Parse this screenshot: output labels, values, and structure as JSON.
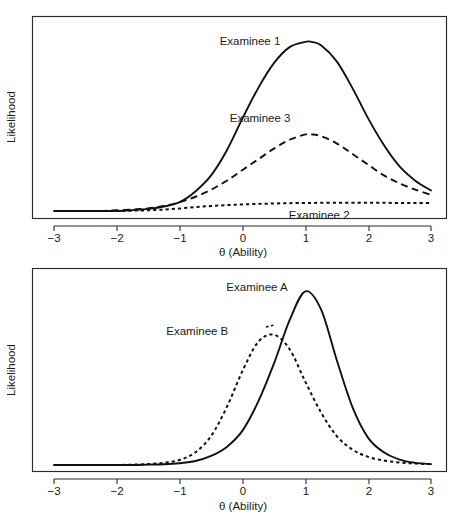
{
  "figure": {
    "name": "likelihood-functions-ability",
    "panel_count": 2
  },
  "chart_data": [
    {
      "type": "line",
      "panel": "top",
      "title": "",
      "xlabel": "θ (Ability)",
      "ylabel": "Likelihood",
      "xlim": [
        -3,
        3
      ],
      "ylim": [
        0,
        1.05
      ],
      "xticks": [
        -3,
        -2,
        -1,
        0,
        1,
        2,
        3
      ],
      "xticklabels": [
        "−3",
        "−2",
        "−1",
        "0",
        "1",
        "2",
        "3"
      ],
      "yticks": [],
      "grid": false,
      "legend": "inline-annotations",
      "x": [
        -3.0,
        -2.75,
        -2.5,
        -2.25,
        -2.0,
        -1.75,
        -1.5,
        -1.25,
        -1.0,
        -0.75,
        -0.5,
        -0.25,
        0.0,
        0.25,
        0.5,
        0.75,
        1.0,
        1.1,
        1.25,
        1.5,
        1.75,
        2.0,
        2.25,
        2.5,
        2.75,
        3.0
      ],
      "series": [
        {
          "name": "Examinee 1",
          "style": "solid",
          "peak_x": 1.1,
          "peak_y": 0.95,
          "label_x": 0.12,
          "label_y": 0.93,
          "values": [
            0.0,
            0.0,
            0.0,
            0.0,
            0.0,
            0.005,
            0.012,
            0.025,
            0.05,
            0.11,
            0.2,
            0.34,
            0.52,
            0.69,
            0.83,
            0.92,
            0.95,
            0.95,
            0.93,
            0.84,
            0.69,
            0.52,
            0.37,
            0.25,
            0.17,
            0.115
          ]
        },
        {
          "name": "Examinee 3",
          "style": "dashed",
          "peak_x": 1.0,
          "peak_y": 0.43,
          "label_x": 0.28,
          "label_y": 0.5,
          "values": [
            0.0,
            0.0,
            0.0,
            0.0,
            0.004,
            0.008,
            0.015,
            0.028,
            0.05,
            0.08,
            0.12,
            0.17,
            0.23,
            0.29,
            0.35,
            0.4,
            0.43,
            0.43,
            0.42,
            0.38,
            0.32,
            0.26,
            0.2,
            0.155,
            0.12,
            0.09
          ]
        },
        {
          "name": "Examinee 2",
          "style": "dotted",
          "peak_x": 2.0,
          "peak_y": 0.045,
          "label_x": 1.22,
          "label_y": -0.045,
          "values": [
            0.0,
            0.0,
            0.0,
            0.0,
            0.0,
            0.002,
            0.004,
            0.008,
            0.014,
            0.022,
            0.028,
            0.033,
            0.037,
            0.04,
            0.042,
            0.044,
            0.045,
            0.045,
            0.046,
            0.046,
            0.046,
            0.046,
            0.046,
            0.045,
            0.045,
            0.045
          ]
        }
      ]
    },
    {
      "type": "line",
      "panel": "bottom",
      "title": "",
      "xlabel": "θ (Ability)",
      "ylabel": "Likelihood",
      "xlim": [
        -3,
        3
      ],
      "ylim": [
        0,
        1.05
      ],
      "xticks": [
        -3,
        -2,
        -1,
        0,
        1,
        2,
        3
      ],
      "xticklabels": [
        "−3",
        "−2",
        "−1",
        "0",
        "1",
        "2",
        "3"
      ],
      "yticks": [],
      "grid": false,
      "legend": "inline-annotations",
      "x": [
        -3.0,
        -2.75,
        -2.5,
        -2.25,
        -2.0,
        -1.75,
        -1.5,
        -1.25,
        -1.0,
        -0.75,
        -0.5,
        -0.25,
        0.0,
        0.25,
        0.5,
        0.75,
        1.0,
        1.25,
        1.5,
        1.75,
        2.0,
        2.25,
        2.5,
        2.75,
        3.0
      ],
      "series": [
        {
          "name": "Examinee A",
          "style": "solid",
          "peak_x": 1.0,
          "peak_y": 0.96,
          "label_x": 0.23,
          "label_y": 0.96,
          "values": [
            0.0,
            0.0,
            0.0,
            0.0,
            0.0,
            0.0,
            0.002,
            0.004,
            0.01,
            0.022,
            0.05,
            0.1,
            0.19,
            0.35,
            0.56,
            0.8,
            0.96,
            0.86,
            0.58,
            0.32,
            0.15,
            0.07,
            0.03,
            0.012,
            0.005
          ]
        },
        {
          "name": "Examinee B",
          "style": "dotted",
          "peak_x": 0.5,
          "peak_y": 0.72,
          "label_x": -0.72,
          "label_y": 0.72,
          "values": [
            0.0,
            0.0,
            0.0,
            0.0,
            0.0,
            0.002,
            0.005,
            0.012,
            0.028,
            0.07,
            0.16,
            0.32,
            0.52,
            0.68,
            0.72,
            0.64,
            0.46,
            0.29,
            0.16,
            0.085,
            0.045,
            0.025,
            0.014,
            0.008,
            0.005
          ]
        }
      ]
    }
  ]
}
